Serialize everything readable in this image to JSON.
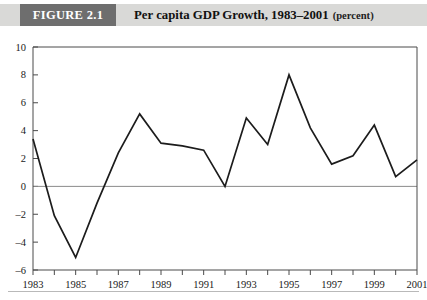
{
  "figure": {
    "badge_label": "FIGURE 2.1",
    "caption_main": "Per capita GDP Growth, 1983–2001",
    "caption_unit": "(percent)",
    "badge_bg": "#6e6e6e",
    "header_bg": "#d9d9d7",
    "badge_text_color": "#ffffff"
  },
  "chart_data": {
    "type": "line",
    "title": "Per capita GDP Growth, 1983–2001 (percent)",
    "xlabel": "",
    "ylabel": "",
    "unit": "percent",
    "grid": false,
    "legend": "none",
    "zero_line": true,
    "line_color": "#1c1c1c",
    "xlim": [
      1983,
      2001
    ],
    "ylim": [
      -6,
      10
    ],
    "y_ticks": [
      -6,
      -4,
      -2,
      0,
      2,
      4,
      6,
      8,
      10
    ],
    "y_tick_labels": [
      "–6",
      "–4",
      "–2",
      "0",
      "2",
      "4",
      "6",
      "8",
      "10"
    ],
    "x_ticks": [
      1983,
      1984,
      1985,
      1986,
      1987,
      1988,
      1989,
      1990,
      1991,
      1992,
      1993,
      1994,
      1995,
      1996,
      1997,
      1998,
      1999,
      2000,
      2001
    ],
    "x_tick_labels": [
      "1983",
      "",
      "1985",
      "",
      "1987",
      "",
      "1989",
      "",
      "1991",
      "",
      "1993",
      "",
      "1995",
      "",
      "1997",
      "",
      "1999",
      "",
      "2001"
    ],
    "x_labels_visible": [
      "1983",
      "1985",
      "1987",
      "1989",
      "1991",
      "1993",
      "1995",
      "1997",
      "1999",
      "2001"
    ],
    "x": [
      1983,
      1984,
      1985,
      1986,
      1987,
      1988,
      1989,
      1990,
      1991,
      1992,
      1993,
      1994,
      1995,
      1996,
      1997,
      1998,
      1999,
      2000,
      2001
    ],
    "values": [
      3.4,
      -2.1,
      -5.1,
      -1.2,
      2.4,
      5.2,
      3.1,
      2.9,
      2.6,
      0.0,
      4.9,
      3.0,
      8.0,
      4.2,
      1.6,
      2.2,
      4.4,
      0.7,
      1.9
    ],
    "series": [
      {
        "name": "Per capita GDP Growth",
        "values": [
          3.4,
          -2.1,
          -5.1,
          -1.2,
          2.4,
          5.2,
          3.1,
          2.9,
          2.6,
          0.0,
          4.9,
          3.0,
          8.0,
          4.2,
          1.6,
          2.2,
          4.4,
          0.7,
          1.9
        ]
      }
    ]
  }
}
